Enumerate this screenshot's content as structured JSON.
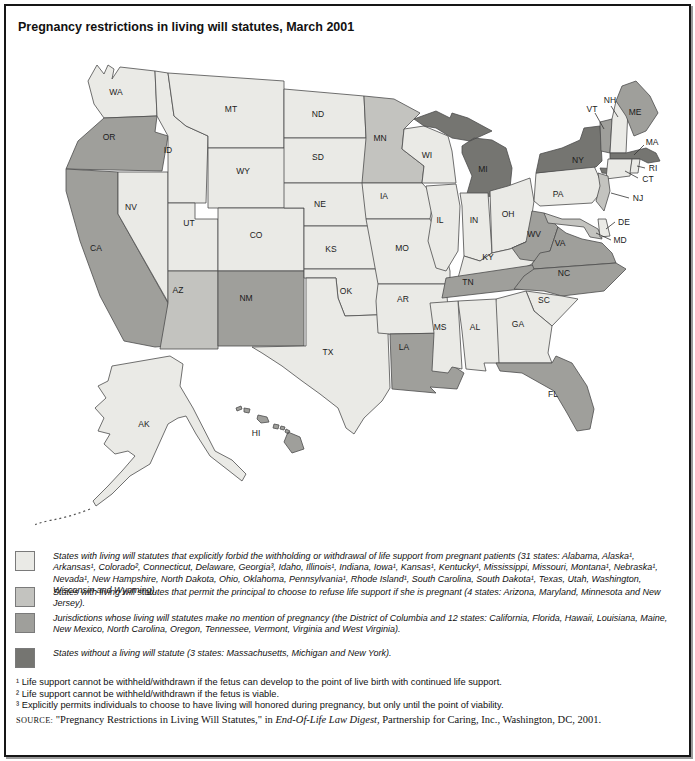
{
  "title": "Pregnancy restrictions in living will statutes, March 2001",
  "map": {
    "category_colors": [
      "#eaeae6",
      "#c3c3bf",
      "#9f9f9b",
      "#757571"
    ],
    "states": [
      {
        "id": "WA",
        "label": "WA",
        "category": 0,
        "lx": 116,
        "ly": 94
      },
      {
        "id": "OR",
        "label": "OR",
        "category": 2,
        "lx": 109,
        "ly": 139
      },
      {
        "id": "CA",
        "label": "CA",
        "category": 2,
        "lx": 96,
        "ly": 250
      },
      {
        "id": "NV",
        "label": "NV",
        "category": 0,
        "lx": 131,
        "ly": 209
      },
      {
        "id": "ID",
        "label": "ID",
        "category": 0,
        "lx": 168,
        "ly": 152
      },
      {
        "id": "MT",
        "label": "MT",
        "category": 0,
        "lx": 231,
        "ly": 111
      },
      {
        "id": "WY",
        "label": "WY",
        "category": 0,
        "lx": 243,
        "ly": 173
      },
      {
        "id": "UT",
        "label": "UT",
        "category": 0,
        "lx": 189,
        "ly": 225
      },
      {
        "id": "CO",
        "label": "CO",
        "category": 0,
        "lx": 256,
        "ly": 237
      },
      {
        "id": "AZ",
        "label": "AZ",
        "category": 1,
        "lx": 178,
        "ly": 292
      },
      {
        "id": "NM",
        "label": "NM",
        "category": 2,
        "lx": 246,
        "ly": 300
      },
      {
        "id": "ND",
        "label": "ND",
        "category": 0,
        "lx": 318,
        "ly": 116
      },
      {
        "id": "SD",
        "label": "SD",
        "category": 0,
        "lx": 318,
        "ly": 159
      },
      {
        "id": "NE",
        "label": "NE",
        "category": 0,
        "lx": 320,
        "ly": 206
      },
      {
        "id": "KS",
        "label": "KS",
        "category": 0,
        "lx": 331,
        "ly": 251
      },
      {
        "id": "OK",
        "label": "OK",
        "category": 0,
        "lx": 346,
        "ly": 293
      },
      {
        "id": "TX",
        "label": "TX",
        "category": 0,
        "lx": 328,
        "ly": 354
      },
      {
        "id": "MN",
        "label": "MN",
        "category": 1,
        "lx": 380,
        "ly": 140
      },
      {
        "id": "IA",
        "label": "IA",
        "category": 0,
        "lx": 384,
        "ly": 198
      },
      {
        "id": "MO",
        "label": "MO",
        "category": 0,
        "lx": 402,
        "ly": 250
      },
      {
        "id": "AR",
        "label": "AR",
        "category": 0,
        "lx": 403,
        "ly": 301
      },
      {
        "id": "LA",
        "label": "LA",
        "category": 2,
        "lx": 404,
        "ly": 349
      },
      {
        "id": "WI",
        "label": "WI",
        "category": 0,
        "lx": 427,
        "ly": 157
      },
      {
        "id": "IL",
        "label": "IL",
        "category": 0,
        "lx": 440,
        "ly": 222
      },
      {
        "id": "IN",
        "label": "IN",
        "category": 0,
        "lx": 474,
        "ly": 222
      },
      {
        "id": "OH",
        "label": "OH",
        "category": 0,
        "lx": 508,
        "ly": 216
      },
      {
        "id": "MI",
        "label": "MI",
        "category": 3,
        "lx": 483,
        "ly": 171
      },
      {
        "id": "KY",
        "label": "KY",
        "category": 0,
        "lx": 488,
        "ly": 259
      },
      {
        "id": "TN",
        "label": "TN",
        "category": 2,
        "lx": 468,
        "ly": 284
      },
      {
        "id": "MS",
        "label": "MS",
        "category": 0,
        "lx": 440,
        "ly": 329
      },
      {
        "id": "AL",
        "label": "AL",
        "category": 0,
        "lx": 475,
        "ly": 329
      },
      {
        "id": "GA",
        "label": "GA",
        "category": 0,
        "lx": 518,
        "ly": 326
      },
      {
        "id": "SC",
        "label": "SC",
        "category": 0,
        "lx": 544,
        "ly": 302
      },
      {
        "id": "NC",
        "label": "NC",
        "category": 2,
        "lx": 564,
        "ly": 275
      },
      {
        "id": "VA",
        "label": "VA",
        "category": 2,
        "lx": 560,
        "ly": 245
      },
      {
        "id": "WV",
        "label": "WV",
        "category": 2,
        "lx": 534,
        "ly": 236
      },
      {
        "id": "FL",
        "label": "FL",
        "category": 2,
        "lx": 553,
        "ly": 396
      },
      {
        "id": "AK",
        "label": "AK",
        "category": 0,
        "lx": 144,
        "ly": 426
      },
      {
        "id": "HI",
        "label": "HI",
        "category": 2,
        "lx": 256,
        "ly": 435
      },
      {
        "id": "ME",
        "label": "ME",
        "category": 2,
        "lx": 635,
        "ly": 114
      },
      {
        "id": "PA",
        "label": "PA",
        "category": 0,
        "lx": 558,
        "ly": 196
      },
      {
        "id": "NY",
        "label": "NY",
        "category": 3,
        "lx": 578,
        "ly": 162
      },
      {
        "id": "VT",
        "label": "VT",
        "category": 2,
        "lx": 592,
        "ly": 111
      },
      {
        "id": "NH",
        "label": "NH",
        "category": 0,
        "lx": 610,
        "ly": 102
      },
      {
        "id": "MA",
        "label": "MA",
        "category": 3,
        "lx": 652,
        "ly": 144
      },
      {
        "id": "RI",
        "label": "RI",
        "category": 0,
        "lx": 653,
        "ly": 170
      },
      {
        "id": "CT",
        "label": "CT",
        "category": 0,
        "lx": 648,
        "ly": 181
      },
      {
        "id": "NJ",
        "label": "NJ",
        "category": 1,
        "lx": 638,
        "ly": 200
      },
      {
        "id": "DE",
        "label": "DE",
        "category": 0,
        "lx": 624,
        "ly": 224
      },
      {
        "id": "MD",
        "label": "MD",
        "category": 1,
        "lx": 620,
        "ly": 242
      }
    ]
  },
  "legend": {
    "items": [
      {
        "text": "States with living will statutes that explicitly forbid the withholding or withdrawal of life support from pregnant patients (31 states: Alabama, Alaska¹, Arkansas¹, Colorado², Connecticut, Delaware, Georgia³, Idaho, Illinois¹, Indiana, Iowa¹, Kansas¹, Kentucky¹, Mississippi, Missouri, Montana¹, Nebraska¹, Nevada¹, New Hampshire, North Dakota, Ohio, Oklahoma, Pennsylvania¹, Rhode Island¹, South Carolina, South Dakota¹, Texas, Utah, Washington, Wisconsin and Wyoming)."
      },
      {
        "text": "States with living will statutes that permit the principal to choose to refuse life support if she is pregnant (4 states: Arizona, Maryland, Minnesota and New Jersey)."
      },
      {
        "text": "Jurisdictions whose living will statutes make no mention of pregnancy (the District of Columbia and 12 states: California, Florida, Hawaii, Louisiana, Maine, New Mexico, North Carolina, Oregon, Tennessee, Vermont, Virginia and West Virginia)."
      },
      {
        "text": "States without a living will statute (3 states: Massachusetts, Michigan and New York)."
      }
    ]
  },
  "footnotes": [
    "¹ Life support cannot be withheld/withdrawn if the fetus can develop to the point of live birth with continued life support.",
    "² Life support cannot be withheld/withdrawn if the fetus is viable.",
    "³ Explicitly permits individuals to choose to have living will honored during pregnancy, but only until the point of viability."
  ],
  "source": {
    "label": "SOURCE:",
    "before": " \"Pregnancy Restrictions in Living Will Statutes,\" in ",
    "italic": "End-Of-Life Law Digest",
    "after": ", Partnership for Caring, Inc., Washington, DC, 2001."
  }
}
